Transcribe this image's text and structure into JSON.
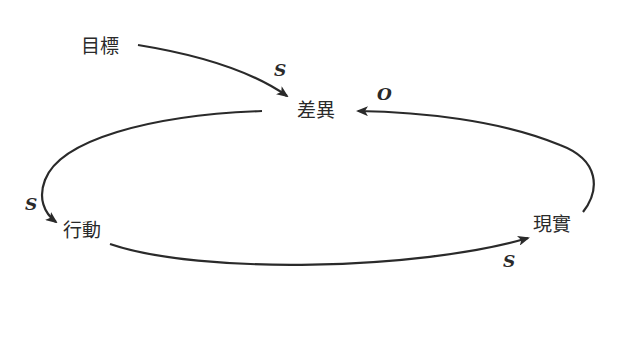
{
  "diagram": {
    "type": "causal-loop",
    "nodes": {
      "goal": "目標",
      "gap": "差異",
      "action": "行動",
      "reality": "現實"
    },
    "links": [
      {
        "from": "目標",
        "to": "差異",
        "polarity": "S"
      },
      {
        "from": "差異",
        "to": "行動",
        "polarity": "S"
      },
      {
        "from": "行動",
        "to": "現實",
        "polarity": "S"
      },
      {
        "from": "現實",
        "to": "差異",
        "polarity": "O"
      }
    ],
    "labels": {
      "goal_gap": "S",
      "gap_action": "S",
      "action_reality": "S",
      "reality_gap": "O"
    },
    "colors": {
      "line": "#2a2a2a",
      "background": "#ffffff"
    }
  }
}
